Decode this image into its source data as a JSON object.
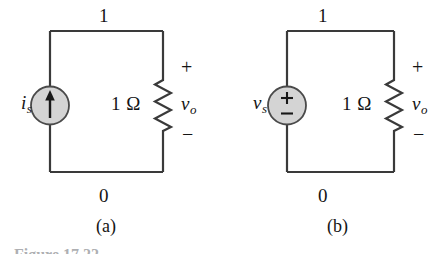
{
  "figure": {
    "caption_clipped": "Figure 17.22",
    "background_color": "#ffffff",
    "wire_color": "#3a3a3a",
    "source_fill_color": "#d4d4d4",
    "source_stroke_color": "#4a4a4a",
    "text_color": "#141414"
  },
  "circuits": [
    {
      "id": "a",
      "sub_caption": "(a)",
      "node_top_label": "1",
      "node_bottom_label": "0",
      "source": {
        "type": "current-source",
        "symbol": "up-arrow",
        "label_main": "i",
        "label_sub": "s"
      },
      "resistor": {
        "value": "1",
        "unit": "Ω",
        "label": "1 Ω"
      },
      "output": {
        "label_main": "v",
        "label_sub": "o",
        "polarity_plus": "+",
        "polarity_minus": "−"
      }
    },
    {
      "id": "b",
      "sub_caption": "(b)",
      "node_top_label": "1",
      "node_bottom_label": "0",
      "source": {
        "type": "voltage-source",
        "symbol": "plus-minus",
        "symbol_plus": "+",
        "symbol_minus": "−",
        "label_main": "v",
        "label_sub": "s"
      },
      "resistor": {
        "value": "1",
        "unit": "Ω",
        "label": "1 Ω"
      },
      "output": {
        "label_main": "v",
        "label_sub": "o",
        "polarity_plus": "+",
        "polarity_minus": "−"
      }
    }
  ]
}
